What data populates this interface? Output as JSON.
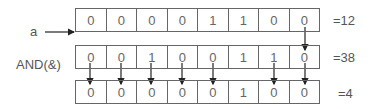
{
  "operand_a": {
    "label": "a",
    "bits": [
      "0",
      "0",
      "0",
      "0",
      "1",
      "1",
      "0",
      "0"
    ],
    "value_label": "=12"
  },
  "operand_b": {
    "label": "AND(&)",
    "bits": [
      "0",
      "0",
      "1",
      "0",
      "0",
      "1",
      "1",
      "0"
    ],
    "value_label": "=38"
  },
  "result": {
    "bits": [
      "0",
      "0",
      "0",
      "0",
      "0",
      "1",
      "0",
      "0"
    ],
    "value_label": "=4"
  },
  "arrows_row1_to_row2": [
    8
  ],
  "arrows_row2_to_row3": [
    1,
    2,
    3,
    4,
    5,
    7,
    8
  ]
}
